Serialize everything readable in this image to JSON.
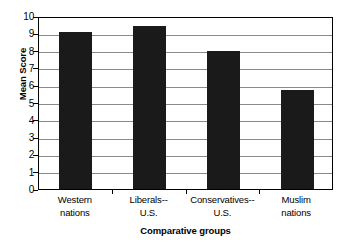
{
  "chart_data": {
    "type": "bar",
    "title": "",
    "subtitle": "",
    "xlabel": "Comparative groups",
    "ylabel": "Mean Score",
    "categories": [
      "Western nations",
      "Liberals-- U.S.",
      "Conservatives-- U.S.",
      "Muslim nations"
    ],
    "category_lines": [
      [
        "Western",
        "nations"
      ],
      [
        "Liberals--",
        "U.S."
      ],
      [
        "Conservatives--",
        "U.S."
      ],
      [
        "Muslim",
        "nations"
      ]
    ],
    "values": [
      9.1,
      9.4,
      8.0,
      5.7
    ],
    "ylim": [
      0,
      10
    ],
    "ytick_labels": [
      "10",
      "9",
      "8",
      "7",
      "6",
      "5",
      "4",
      "3",
      "2",
      "1",
      "0"
    ],
    "ytick_values": [
      10,
      9,
      8,
      7,
      6,
      5,
      4,
      3,
      2,
      1,
      0
    ],
    "grid": true,
    "legend": "none",
    "bar_color": "#1a1a1a",
    "gridline_color": "#8a8a8a",
    "axis_color": "#000000",
    "background_color": "#ffffff"
  }
}
